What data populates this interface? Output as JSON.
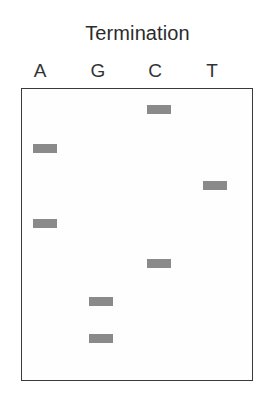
{
  "figure": {
    "title": "Termination",
    "width": 275,
    "height": 401,
    "background_color": "#ffffff",
    "gel": {
      "border_color": "#3a3a3a",
      "fill_color": "#fefefe",
      "left": 21,
      "top": 88,
      "width": 232,
      "height": 293
    },
    "band_color": "#8a8a8a"
  },
  "lanes": [
    {
      "label": "A",
      "center_x": 40
    },
    {
      "label": "G",
      "center_x": 98
    },
    {
      "label": "C",
      "center_x": 155
    },
    {
      "label": "T",
      "center_x": 212
    }
  ],
  "chart_data": {
    "type": "table",
    "title": "Termination",
    "xlabel": "",
    "ylabel": "",
    "categories": [
      "A",
      "G",
      "C",
      "T"
    ],
    "bands": [
      {
        "lane": "C",
        "x": 146,
        "y": 104,
        "width": 24,
        "height": 9
      },
      {
        "lane": "A",
        "x": 32,
        "y": 143,
        "width": 24,
        "height": 9
      },
      {
        "lane": "T",
        "x": 202,
        "y": 180,
        "width": 24,
        "height": 9
      },
      {
        "lane": "A",
        "x": 32,
        "y": 218,
        "width": 24,
        "height": 9
      },
      {
        "lane": "C",
        "x": 146,
        "y": 258,
        "width": 24,
        "height": 9
      },
      {
        "lane": "G",
        "x": 88,
        "y": 296,
        "width": 24,
        "height": 9
      },
      {
        "lane": "G",
        "x": 88,
        "y": 333,
        "width": 24,
        "height": 9
      }
    ]
  }
}
